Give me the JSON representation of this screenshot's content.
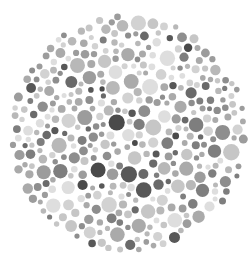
{
  "plate": {
    "type": "color-vision-test-plate",
    "center": [
      128,
      133
    ],
    "radius": 120,
    "background": "#ffffff",
    "palette": [
      "#dedede",
      "#d2d2d2",
      "#c6c6c6",
      "#b8b8b8",
      "#aaaaaa",
      "#9c9c9c",
      "#8e8e8e",
      "#7e7e7e",
      "#6a6a6a",
      "#585858",
      "#4a4a4a"
    ],
    "palette_weights": [
      10,
      12,
      12,
      12,
      11,
      10,
      9,
      8,
      6,
      4,
      2
    ],
    "min_r": 2.5,
    "max_r": 8.5,
    "seed": 7,
    "attempts": 9000
  }
}
